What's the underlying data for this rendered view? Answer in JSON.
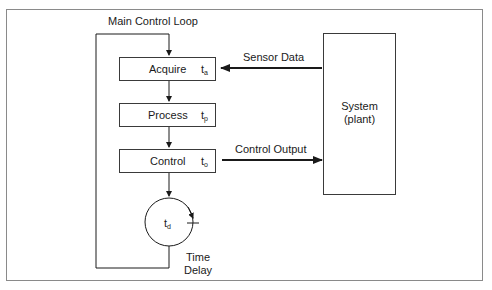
{
  "diagram": {
    "loop_title": "Main Control Loop",
    "blocks": [
      {
        "label": "Acquire",
        "time_symbol": "t",
        "time_subscript": "a"
      },
      {
        "label": "Process",
        "time_symbol": "t",
        "time_subscript": "p"
      },
      {
        "label": "Control",
        "time_symbol": "t",
        "time_subscript": "o"
      }
    ],
    "delay": {
      "time_symbol": "t",
      "time_subscript": "d",
      "label_line1": "Time",
      "label_line2": "Delay"
    },
    "system": {
      "line1": "System",
      "line2": "(plant)"
    },
    "arrows": {
      "sensor": "Sensor Data",
      "output": "Control Output"
    },
    "colors": {
      "stroke": "#1a1a1a",
      "frame": "#8a8a8a",
      "background": "#ffffff"
    }
  }
}
